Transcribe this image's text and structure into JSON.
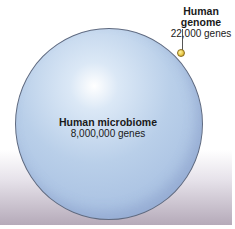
{
  "diagram": {
    "genome": {
      "title": "Human genome",
      "subtitle": "22,000 genes",
      "color": "#e8c84a"
    },
    "microbiome": {
      "title": "Human microbiome",
      "subtitle": "8,000,000 genes",
      "color": "#b9cfe9"
    }
  }
}
